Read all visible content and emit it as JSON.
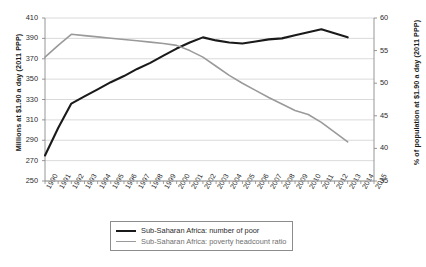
{
  "chart_data": {
    "type": "line",
    "title": "",
    "xlabel": "",
    "ylabel": "Millions at $1.90 a day (2011 PPP)",
    "y2label": "% of population at $1.90 a day (2011 PPP)",
    "grid": true,
    "legend_position": "bottom-center",
    "x": [
      1990,
      1991,
      1992,
      1993,
      1994,
      1995,
      1996,
      1997,
      1998,
      1999,
      2000,
      2001,
      2002,
      2003,
      2004,
      2005,
      2006,
      2007,
      2008,
      2009,
      2010,
      2011,
      2012,
      2013,
      2014,
      2015
    ],
    "x_tick_labels": [
      "1990",
      "1991",
      "1992",
      "1993",
      "1994",
      "1995",
      "1996",
      "1997",
      "1998",
      "1999",
      "2000",
      "2001",
      "2002",
      "2003",
      "2004",
      "2005",
      "2006",
      "2007",
      "2008",
      "2009",
      "2010",
      "2011",
      "2012",
      "2013",
      "2014",
      "2015"
    ],
    "ylim": [
      250,
      410
    ],
    "y_ticks": [
      250,
      270,
      290,
      310,
      330,
      350,
      370,
      390,
      410
    ],
    "y2lim": [
      35,
      60
    ],
    "y2_ticks": [
      35,
      40,
      45,
      50,
      55,
      60
    ],
    "series": [
      {
        "name": "Sub-Saharan Africa: number of poor",
        "axis": "left",
        "color": "#1a1a1a",
        "width": 2.1,
        "x": [
          1990,
          1991,
          1992,
          1993,
          1994,
          1995,
          1996,
          1997,
          1998,
          1999,
          2000,
          2001,
          2002,
          2003,
          2004,
          2005,
          2006,
          2007,
          2008,
          2009,
          2010,
          2011,
          2012,
          2013
        ],
        "values": [
          275,
          302,
          326,
          333,
          340,
          347,
          353,
          360,
          366,
          373,
          380,
          386,
          391,
          388,
          386,
          385,
          387,
          389,
          390,
          393,
          396,
          399,
          395,
          391
        ]
      },
      {
        "name": "Sub-Saharan Africa: poverty headcount ratio",
        "axis": "right",
        "color": "#9a9a9a",
        "width": 1.6,
        "x": [
          1990,
          1991,
          1992,
          1993,
          1994,
          1995,
          1996,
          1997,
          1998,
          1999,
          2000,
          2001,
          2002,
          2003,
          2004,
          2005,
          2006,
          2007,
          2008,
          2009,
          2010,
          2011,
          2012,
          2013
        ],
        "values": [
          54.0,
          55.8,
          57.5,
          57.3,
          57.1,
          56.9,
          56.7,
          56.5,
          56.3,
          56.1,
          55.8,
          55.0,
          54.0,
          52.6,
          51.2,
          50.0,
          48.9,
          47.8,
          46.8,
          45.8,
          45.2,
          44.0,
          42.5,
          41.0
        ]
      }
    ]
  },
  "legend": {
    "items": [
      {
        "label": "Sub-Saharan Africa: number of poor"
      },
      {
        "label": "Sub-Saharan Africa: poverty headcount ratio"
      }
    ]
  }
}
